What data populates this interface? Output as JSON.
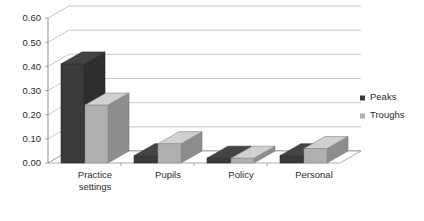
{
  "chart_data": {
    "type": "bar",
    "title": "",
    "subtitle": "",
    "xlabel": "",
    "ylabel": "",
    "categories": [
      "Practice settings",
      "Pupils",
      "Policy",
      "Personal"
    ],
    "category_lines": [
      [
        "Practice",
        "settings"
      ],
      [
        "Pupils"
      ],
      [
        "Policy"
      ],
      [
        "Personal"
      ]
    ],
    "series": [
      {
        "name": "Peaks",
        "color": "#3a3a3a",
        "values": [
          0.41,
          0.03,
          0.02,
          0.03
        ]
      },
      {
        "name": "Troughs",
        "color": "#b0b0b0",
        "values": [
          0.24,
          0.08,
          0.02,
          0.06
        ]
      }
    ],
    "ylim": [
      0.0,
      0.6
    ],
    "ytick_values": [
      0.0,
      0.1,
      0.2,
      0.3,
      0.4,
      0.5,
      0.6
    ],
    "ytick_labels": [
      "0.00",
      "0.10",
      "0.20",
      "0.30",
      "0.40",
      "0.50",
      "0.60"
    ],
    "grid": true,
    "grid_axis": "y",
    "legend_position": "right",
    "perspective": "3d",
    "background_color": "#ffffff",
    "gridline_color": "#b9b9b9",
    "axis_color": "#8f8f8f",
    "text_color": "#2b2b2b"
  },
  "legend": {
    "entries": [
      {
        "label": "Peaks",
        "marker": "square-marker",
        "color": "#3a3a3a"
      },
      {
        "label": "Troughs",
        "marker": "square-marker",
        "color": "#b0b0b0"
      }
    ]
  }
}
